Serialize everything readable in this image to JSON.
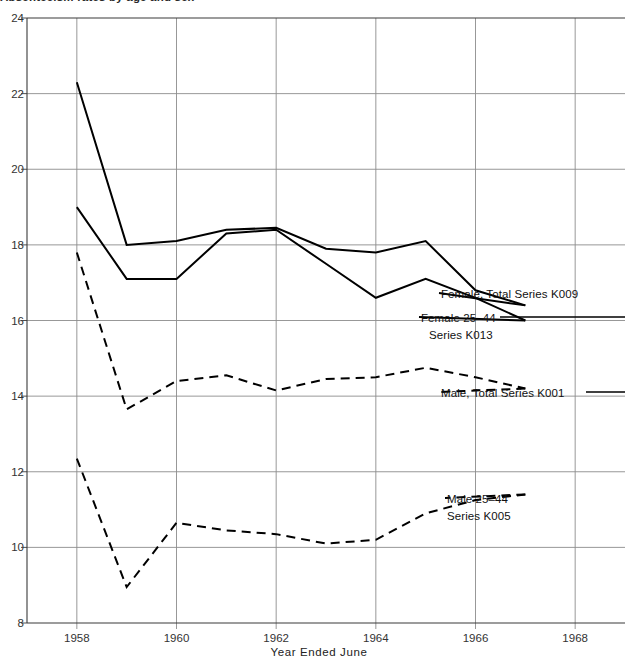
{
  "chart_data": {
    "type": "line",
    "title": "Absenteeism rates by age and sex",
    "xlabel": "Year Ended June",
    "ylabel": "",
    "xlim": [
      1957,
      1969
    ],
    "ylim": [
      8,
      24
    ],
    "grid": true,
    "legend_position": "inline-right-annotations",
    "xticks": [
      1958,
      1960,
      1962,
      1964,
      1966,
      1968
    ],
    "xtick_labels": [
      "1958",
      "1960",
      "1962",
      "1964",
      "1966",
      "1968"
    ],
    "yticks": [
      8,
      10,
      12,
      14,
      16,
      18,
      20,
      22,
      24
    ],
    "ytick_labels": [
      "8",
      "10",
      "12",
      "14",
      "16",
      "18",
      "20",
      "22",
      "24"
    ],
    "x": [
      1958,
      1959,
      1960,
      1961,
      1962,
      1963,
      1964,
      1965,
      1966,
      1967
    ],
    "series": [
      {
        "name": "Female, Total Series K009",
        "label": "Female, Total Series K009",
        "code": "K009",
        "style": "solid",
        "color": "#000000",
        "values": [
          22.3,
          18.0,
          18.1,
          18.4,
          18.45,
          17.9,
          17.8,
          18.1,
          16.8,
          16.4
        ]
      },
      {
        "name": "Female 25-44 Series K013",
        "label_line1": "Female 25–44",
        "label_line2": "Series K013",
        "code": "K013",
        "style": "solid",
        "color": "#000000",
        "values": [
          19.0,
          17.1,
          17.1,
          18.3,
          18.4,
          17.5,
          16.6,
          17.1,
          16.6,
          16.0
        ]
      },
      {
        "name": "Male, Total Series K001",
        "label": "Male, Total Series K001",
        "code": "K001",
        "style": "dashed",
        "color": "#000000",
        "values": [
          17.8,
          13.65,
          14.4,
          14.55,
          14.15,
          14.45,
          14.5,
          14.75,
          14.5,
          14.2
        ]
      },
      {
        "name": "Male 25-44 Series K005",
        "label_line1": "Male 25–44",
        "label_line2": "Series K005",
        "code": "K005",
        "style": "dashed",
        "color": "#000000",
        "values": [
          12.35,
          8.95,
          10.65,
          10.45,
          10.35,
          10.1,
          10.2,
          10.9,
          11.25,
          11.4
        ]
      }
    ]
  },
  "annotations": {
    "female_total": "Female, Total Series K009",
    "female_2544_line1": "Female 25–44",
    "female_2544_line2": "Series K013",
    "male_total": "Male, Total Series K001",
    "male_2544_line1": "Male 25–44",
    "male_2544_line2": "Series K005"
  },
  "colors": {
    "axis": "#3a3a3a",
    "grid": "#8c8c8c",
    "line": "#000000",
    "text": "#1a1a1a",
    "background": "#ffffff"
  }
}
